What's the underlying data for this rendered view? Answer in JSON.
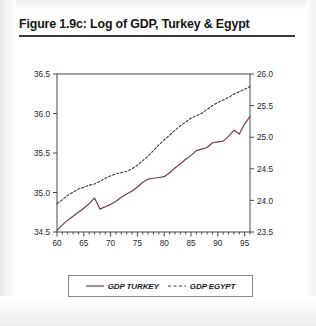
{
  "figure": {
    "title": "Figure 1.9c: Log of GDP, Turkey & Egypt"
  },
  "legend": {
    "entries": [
      {
        "label": "GDP TURKEY",
        "style": "solid",
        "color": "#7a3b46"
      },
      {
        "label": "GDP EGYPT",
        "style": "dashed",
        "color": "#3c3c3c"
      }
    ]
  },
  "chart_data": {
    "type": "line",
    "title": "Figure 1.9c: Log of GDP, Turkey & Egypt",
    "xlabel": "",
    "ylabel": "",
    "xlim": [
      60,
      96
    ],
    "grid": false,
    "legend_position": "bottom",
    "x_tick_labels": [
      "60",
      "65",
      "70",
      "75",
      "80",
      "85",
      "90",
      "95"
    ],
    "x_tick_values": [
      60,
      65,
      70,
      75,
      80,
      85,
      90,
      95
    ],
    "x_minor_tick_step": 1,
    "axes": {
      "left": {
        "label": "",
        "ylim": [
          34.5,
          36.5
        ],
        "ticks": [
          34.5,
          35.0,
          35.5,
          36.0,
          36.5
        ],
        "tick_labels": [
          "34.5",
          "35.0",
          "35.5",
          "36.0",
          "36.5"
        ],
        "series": "GDP TURKEY"
      },
      "right": {
        "label": "",
        "ylim": [
          23.5,
          26.0
        ],
        "ticks": [
          23.5,
          24.0,
          24.5,
          25.0,
          25.5,
          26.0
        ],
        "tick_labels": [
          "23.5",
          "24.0",
          "24.5",
          "25.0",
          "25.5",
          "26.0"
        ],
        "series": "GDP EGYPT"
      }
    },
    "x": [
      60,
      61,
      62,
      63,
      64,
      65,
      66,
      67,
      68,
      69,
      70,
      71,
      72,
      73,
      74,
      75,
      76,
      77,
      78,
      79,
      80,
      81,
      82,
      83,
      84,
      85,
      86,
      87,
      88,
      89,
      90,
      91,
      92,
      93,
      94,
      95,
      96
    ],
    "series": [
      {
        "name": "GDP TURKEY",
        "axis": "left",
        "style": "solid",
        "color": "#7a3b46",
        "values": [
          34.52,
          34.59,
          34.65,
          34.7,
          34.75,
          34.8,
          34.86,
          34.93,
          34.79,
          34.82,
          34.85,
          34.89,
          34.94,
          34.98,
          35.02,
          35.07,
          35.13,
          35.17,
          35.18,
          35.19,
          35.2,
          35.25,
          35.31,
          35.36,
          35.42,
          35.47,
          35.53,
          35.55,
          35.57,
          35.63,
          35.64,
          35.65,
          35.71,
          35.79,
          35.74,
          35.87,
          35.96
        ]
      },
      {
        "name": "GDP EGYPT",
        "axis": "right",
        "style": "dashed",
        "color": "#3c3c3c",
        "values": [
          23.95,
          24.01,
          24.08,
          24.13,
          24.18,
          24.21,
          24.24,
          24.26,
          24.3,
          24.35,
          24.39,
          24.42,
          24.44,
          24.46,
          24.5,
          24.56,
          24.63,
          24.7,
          24.79,
          24.88,
          24.96,
          25.03,
          25.11,
          25.18,
          25.24,
          25.3,
          25.34,
          25.38,
          25.44,
          25.5,
          25.55,
          25.59,
          25.63,
          25.68,
          25.72,
          25.76,
          25.8
        ]
      }
    ]
  }
}
